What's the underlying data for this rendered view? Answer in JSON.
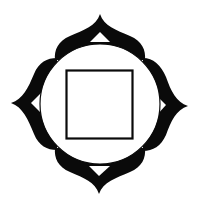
{
  "figure": {
    "title": "Four-petaled lotus with circle and inner square",
    "colors": {
      "background": "#ffffff",
      "ink": "#0a0a0a"
    },
    "petals": [
      "top",
      "right",
      "bottom",
      "left"
    ],
    "circle": {
      "cx": 100,
      "cy": 104,
      "r": 60
    },
    "square": {
      "x": 66,
      "y": 70,
      "width": 67,
      "height": 69
    }
  }
}
